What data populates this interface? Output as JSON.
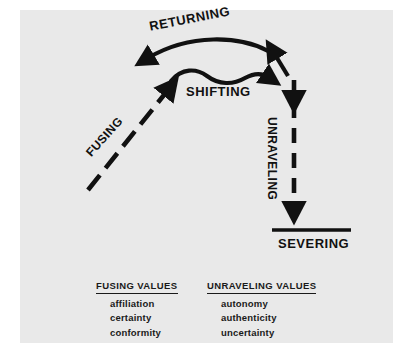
{
  "panel": {
    "background_color": "#e9e9e9",
    "page_background_color": "#ffffff",
    "ink_color": "#111111"
  },
  "diagram": {
    "title": "",
    "type": "relationship-cycle-diagram",
    "stages": [
      {
        "id": "fusing",
        "label": "FUSING",
        "arrow_style": "dashed",
        "direction": "up-right"
      },
      {
        "id": "shifting",
        "label": "SHIFTING",
        "arrow_style": "solid-wavy",
        "direction": "right"
      },
      {
        "id": "returning",
        "label": "RETURNING",
        "arrow_style": "solid-curved",
        "direction": "right-to-left"
      },
      {
        "id": "unraveling",
        "label": "UNRAVELING",
        "arrow_style": "dashed",
        "direction": "down"
      },
      {
        "id": "severing",
        "label": "SEVERING",
        "arrow_style": "terminal-bar",
        "direction": "none"
      }
    ]
  },
  "value_lists": [
    {
      "id": "fusing-values",
      "title": "FUSING VALUES",
      "items": [
        "affiliation",
        "certainty",
        "conformity"
      ]
    },
    {
      "id": "unraveling-values",
      "title": "UNRAVELING VALUES",
      "items": [
        "autonomy",
        "authenticity",
        "uncertainty"
      ]
    }
  ]
}
